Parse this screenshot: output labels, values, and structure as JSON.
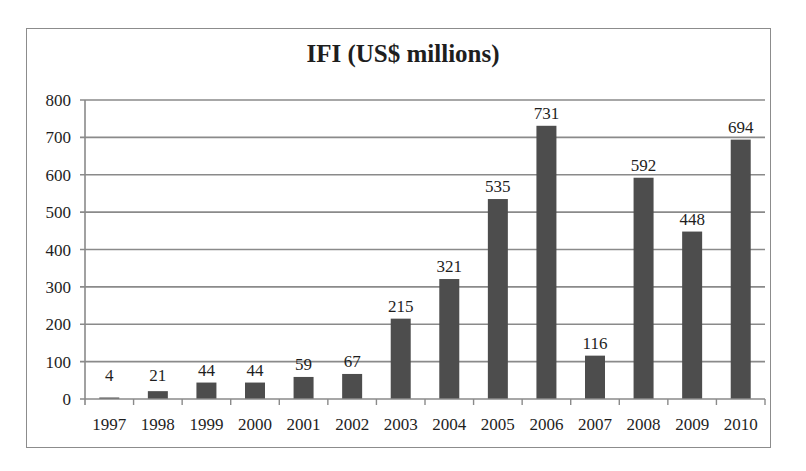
{
  "chart_data": {
    "type": "bar",
    "title": "IFI (US$ millions)",
    "xlabel": "",
    "ylabel": "",
    "categories": [
      "1997",
      "1998",
      "1999",
      "2000",
      "2001",
      "2002",
      "2003",
      "2004",
      "2005",
      "2006",
      "2007",
      "2008",
      "2009",
      "2010"
    ],
    "values": [
      4,
      21,
      44,
      44,
      59,
      67,
      215,
      321,
      535,
      731,
      116,
      592,
      448,
      694
    ],
    "data_labels": [
      "4",
      "21",
      "44",
      "44",
      "59",
      "67",
      "215",
      "321",
      "535",
      "731",
      "116",
      "592",
      "448",
      "694"
    ],
    "ylim": [
      0,
      800
    ],
    "yticks": [
      0,
      100,
      200,
      300,
      400,
      500,
      600,
      700,
      800
    ],
    "grid": true,
    "legend": "none",
    "bar_color": "#4d4d4d",
    "grid_color": "#8a8a8a"
  }
}
